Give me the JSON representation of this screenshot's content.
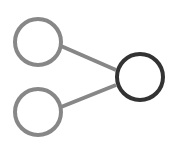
{
  "diagram": {
    "type": "network-icon",
    "nodes": [
      {
        "id": "input-top",
        "role": "input",
        "color": "#878787"
      },
      {
        "id": "input-bottom",
        "role": "input",
        "color": "#878787"
      },
      {
        "id": "output",
        "role": "output",
        "color": "#333333"
      }
    ],
    "edges": [
      {
        "from": "input-top",
        "to": "output",
        "color": "#878787"
      },
      {
        "from": "input-bottom",
        "to": "output",
        "color": "#878787"
      }
    ]
  }
}
